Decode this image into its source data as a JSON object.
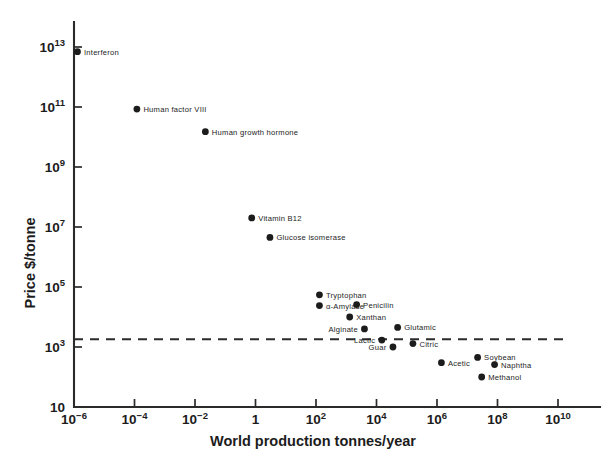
{
  "chart_data": {
    "type": "scatter",
    "title": "",
    "xlabel": "World production tonnes/year",
    "ylabel": "Price $/tonne",
    "xscale": "log",
    "yscale": "log",
    "xlim": [
      1e-06,
      100000000000.0
    ],
    "ylim": [
      10,
      100000000000000.0
    ],
    "xticks": [
      {
        "value": 1e-06,
        "label_base": "10",
        "label_exp": "−6"
      },
      {
        "value": 0.0001,
        "label_base": "10",
        "label_exp": "−4"
      },
      {
        "value": 0.01,
        "label_base": "10",
        "label_exp": "−2"
      },
      {
        "value": 1,
        "label_base": "1",
        "label_exp": ""
      },
      {
        "value": 100.0,
        "label_base": "10",
        "label_exp": "2"
      },
      {
        "value": 10000.0,
        "label_base": "10",
        "label_exp": "4"
      },
      {
        "value": 1000000.0,
        "label_base": "10",
        "label_exp": "6"
      },
      {
        "value": 100000000.0,
        "label_base": "10",
        "label_exp": "8"
      },
      {
        "value": 10000000000.0,
        "label_base": "10",
        "label_exp": "10"
      }
    ],
    "yticks": [
      {
        "value": 10000000000000.0,
        "label_base": "10",
        "label_exp": "13"
      },
      {
        "value": 100000000000.0,
        "label_base": "10",
        "label_exp": "11"
      },
      {
        "value": 1000000000.0,
        "label_base": "10",
        "label_exp": "9"
      },
      {
        "value": 10000000.0,
        "label_base": "10",
        "label_exp": "7"
      },
      {
        "value": 100000.0,
        "label_base": "10",
        "label_exp": "5"
      },
      {
        "value": 1000.0,
        "label_base": "10",
        "label_exp": "3"
      },
      {
        "value": 10,
        "label_base": "10",
        "label_exp": ""
      }
    ],
    "grid": false,
    "legend": null,
    "marker_color": "#1c1c1c",
    "threshold_line": {
      "y": 1800,
      "style": "dashed",
      "label": ""
    },
    "points": [
      {
        "name": "Interferon",
        "x": 1.3e-06,
        "y": 7000000000000.0,
        "label_side": "right"
      },
      {
        "name": "Human factor VIII",
        "x": 0.00012,
        "y": 85000000000.0,
        "label_side": "right"
      },
      {
        "name": "Human growth hormone",
        "x": 0.022,
        "y": 15000000000.0,
        "label_side": "right"
      },
      {
        "name": "Vitamin B12",
        "x": 0.75,
        "y": 20000000.0,
        "label_side": "right"
      },
      {
        "name": "Glucose isomerase",
        "x": 3.0,
        "y": 4500000.0,
        "label_side": "right"
      },
      {
        "name": "Tryptophan",
        "x": 130.0,
        "y": 55000.0,
        "label_side": "right"
      },
      {
        "name": "α-Amylase",
        "x": 130.0,
        "y": 24000.0,
        "label_side": "right"
      },
      {
        "name": "Penicilin",
        "x": 2200.0,
        "y": 26000.0,
        "label_side": "right"
      },
      {
        "name": "Xanthan",
        "x": 1300.0,
        "y": 10000.0,
        "label_side": "right"
      },
      {
        "name": "Alginate",
        "x": 4000.0,
        "y": 4000.0,
        "label_side": "left"
      },
      {
        "name": "Glutamic",
        "x": 50000.0,
        "y": 4500.0,
        "label_side": "right"
      },
      {
        "name": "Lactic",
        "x": 15000.0,
        "y": 1700.0,
        "label_side": "left"
      },
      {
        "name": "Guar",
        "x": 35000.0,
        "y": 1000.0,
        "label_side": "left"
      },
      {
        "name": "Citric",
        "x": 160000.0,
        "y": 1300.0,
        "label_side": "right"
      },
      {
        "name": "Acetic",
        "x": 1400000.0,
        "y": 300.0,
        "label_side": "right"
      },
      {
        "name": "Soybean",
        "x": 22000000.0,
        "y": 450.0,
        "label_side": "right"
      },
      {
        "name": "Naphtha",
        "x": 80000000.0,
        "y": 260.0,
        "label_side": "right"
      },
      {
        "name": "Methanol",
        "x": 30000000.0,
        "y": 100.0,
        "label_side": "right"
      }
    ]
  }
}
